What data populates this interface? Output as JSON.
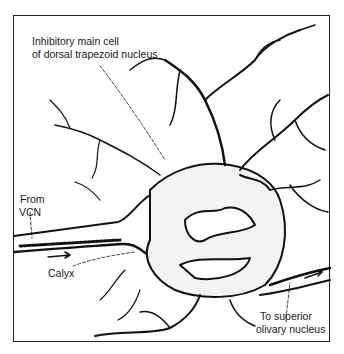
{
  "figure": {
    "type": "neuron illustration",
    "labels": {
      "main_cell_line1": "Inhibitory main cell",
      "main_cell_line2": "of dorsal trapezoid nucleus",
      "from_line1": "From",
      "from_line2": "VCN",
      "calyx": "Calyx",
      "to_line1": "To superior",
      "to_line2": "olivary nucleus"
    }
  }
}
